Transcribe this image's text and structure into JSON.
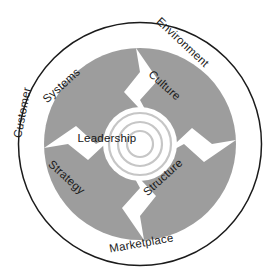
{
  "diagram": {
    "type": "concentric-circular-model",
    "center": {
      "label": "Leadership"
    },
    "inner_ring": {
      "name": "core-elements-ring",
      "fill_color": "#9d9d9d",
      "segments": [
        {
          "id": "systems",
          "label": "Systems",
          "position": "upper-left"
        },
        {
          "id": "culture",
          "label": "Culture",
          "position": "upper-right"
        },
        {
          "id": "structure",
          "label": "Structure",
          "position": "lower-right"
        },
        {
          "id": "strategy",
          "label": "Strategy",
          "position": "lower-left"
        }
      ],
      "arrows": [
        {
          "id": "arrow-top",
          "direction": "right"
        },
        {
          "id": "arrow-right",
          "direction": "down"
        },
        {
          "id": "arrow-bottom",
          "direction": "left"
        },
        {
          "id": "arrow-left",
          "direction": "up"
        }
      ]
    },
    "outer_ring": {
      "name": "external-context-ring",
      "fill_color": "#ffffff",
      "border_color": "#1b1b1b",
      "segments": [
        {
          "id": "customer",
          "label": "Customer",
          "position": "left"
        },
        {
          "id": "environment",
          "label": "Environment",
          "position": "upper-right"
        },
        {
          "id": "marketplace",
          "label": "Marketplace",
          "position": "bottom"
        }
      ]
    },
    "colors": {
      "gray_fill": "#9d9d9d",
      "outline": "#1b1b1b",
      "white": "#ffffff",
      "center_ring_stroke": "#c6c6c6",
      "text": "#1b1b1b"
    }
  }
}
